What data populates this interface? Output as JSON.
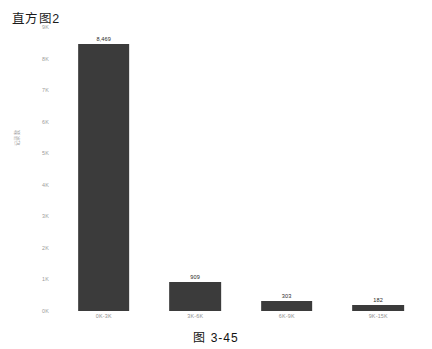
{
  "chart": {
    "title": "直方图2",
    "caption": "图 3-45"
  },
  "chart_data": {
    "type": "bar",
    "title": "直方图2",
    "xlabel": "",
    "ylabel": "记录数",
    "categories": [
      "0K-3K",
      "3K-6K",
      "6K-9K",
      "9K-15K"
    ],
    "values": [
      8469,
      909,
      303,
      182
    ],
    "value_labels": [
      "8,469",
      "909",
      "303",
      "182"
    ],
    "ylim": [
      0,
      9000
    ],
    "yticks": [
      0,
      1000,
      2000,
      3000,
      4000,
      5000,
      6000,
      7000,
      8000,
      9000
    ],
    "ytick_labels": [
      "0K",
      "1K",
      "2K",
      "3K",
      "4K",
      "5K",
      "6K",
      "7K",
      "8K",
      "9K"
    ],
    "grid": false,
    "legend": false,
    "bar_color": "#3b3b3b",
    "background": "#ffffff"
  }
}
